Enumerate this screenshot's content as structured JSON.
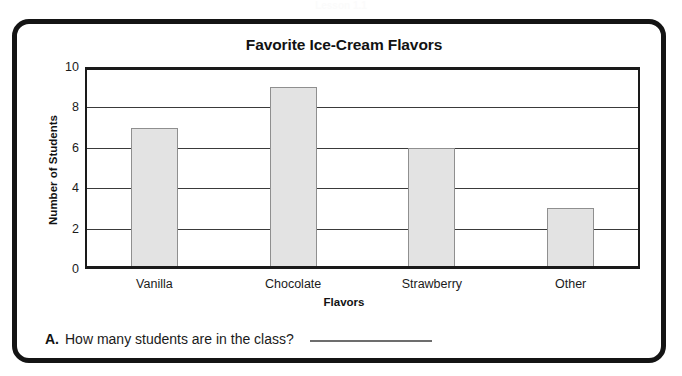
{
  "page": {
    "cropped_header_text": "Lesson 1.1",
    "question": {
      "letter": "A.",
      "text": "How many students are in the class?",
      "answer_value": ""
    }
  },
  "chart_data": {
    "type": "bar",
    "title": "Favorite Ice-Cream Flavors",
    "xlabel": "Flavors",
    "ylabel": "Number of Students",
    "categories": [
      "Vanilla",
      "Chocolate",
      "Strawberry",
      "Other"
    ],
    "values": [
      7,
      9,
      6,
      3
    ],
    "ylim": [
      0,
      10
    ],
    "yticks": [
      0,
      2,
      4,
      6,
      8,
      10
    ],
    "ytick_labels": [
      "0",
      "2",
      "4",
      "6",
      "8",
      "10"
    ],
    "gridlines": [
      2,
      4,
      6,
      8
    ],
    "grid": true,
    "legend": false,
    "bar_fill_color": "#e3e3e3",
    "bar_edge_color": "#8f8f8f",
    "axis_color": "#1a1a1a",
    "total": 25
  }
}
